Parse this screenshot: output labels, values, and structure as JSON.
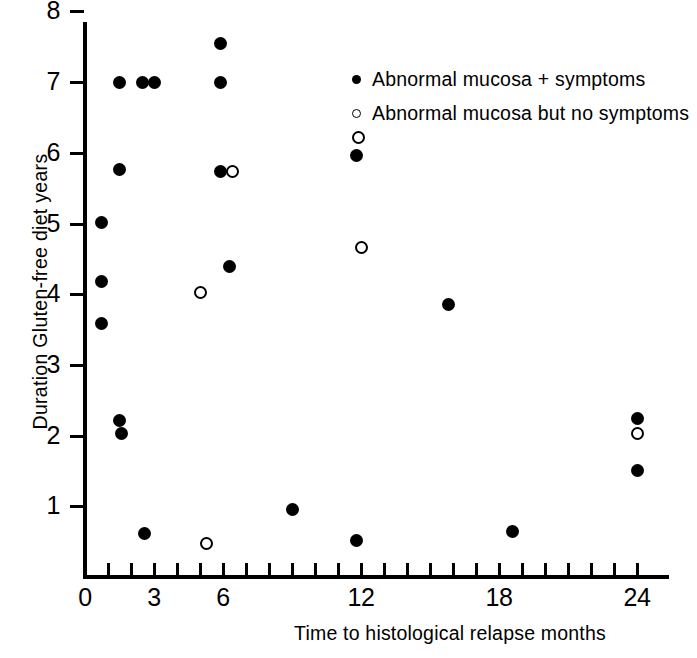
{
  "chart_data": {
    "type": "scatter",
    "title": "",
    "xlabel": "Time to histological relapse months",
    "ylabel": "Duration Gluten-free diet years",
    "xlim": [
      0,
      25
    ],
    "ylim": [
      0,
      8
    ],
    "grid": false,
    "legend_position": "top-right",
    "x_ticks_major": [
      0,
      3,
      6,
      12,
      18,
      24
    ],
    "x_tick_labels": [
      "0",
      "3",
      "6",
      "12",
      "18",
      "24"
    ],
    "x_ticks_minor_step": 1,
    "y_ticks_major": [
      1,
      2,
      3,
      4,
      5,
      6,
      7,
      8
    ],
    "y_tick_labels": [
      "1",
      "2",
      "3",
      "4",
      "5",
      "6",
      "7",
      "8"
    ],
    "y_minor_ticks": [
      0.5,
      1.5,
      2.5,
      3.5,
      4.5,
      5.5,
      6.5,
      7.5
    ],
    "marker_color": "#000000",
    "series": [
      {
        "name": "Abnormal mucosa + symptoms",
        "marker": "filled-circle",
        "points": [
          {
            "x": 0.7,
            "y": 5.02
          },
          {
            "x": 0.7,
            "y": 4.18
          },
          {
            "x": 0.7,
            "y": 3.58
          },
          {
            "x": 1.5,
            "y": 7.0
          },
          {
            "x": 1.5,
            "y": 5.76
          },
          {
            "x": 1.5,
            "y": 2.22
          },
          {
            "x": 1.6,
            "y": 2.03
          },
          {
            "x": 2.5,
            "y": 7.0
          },
          {
            "x": 3.0,
            "y": 7.0
          },
          {
            "x": 2.6,
            "y": 0.62
          },
          {
            "x": 5.9,
            "y": 7.54
          },
          {
            "x": 5.9,
            "y": 7.0
          },
          {
            "x": 5.9,
            "y": 5.73
          },
          {
            "x": 6.3,
            "y": 4.39
          },
          {
            "x": 9.0,
            "y": 0.96
          },
          {
            "x": 11.8,
            "y": 5.96
          },
          {
            "x": 11.8,
            "y": 0.52
          },
          {
            "x": 15.8,
            "y": 3.85
          },
          {
            "x": 18.6,
            "y": 0.64
          },
          {
            "x": 24.0,
            "y": 2.24
          },
          {
            "x": 24.0,
            "y": 1.51
          }
        ]
      },
      {
        "name": "Abnormal mucosa but no symptoms",
        "marker": "open-circle",
        "points": [
          {
            "x": 5.3,
            "y": 0.48
          },
          {
            "x": 5.0,
            "y": 4.03
          },
          {
            "x": 6.4,
            "y": 5.73
          },
          {
            "x": 11.9,
            "y": 6.22
          },
          {
            "x": 12.0,
            "y": 4.66
          },
          {
            "x": 24.0,
            "y": 2.03
          }
        ]
      }
    ]
  },
  "legend": {
    "entries": [
      {
        "marker": "filled-circle",
        "label": "Abnormal mucosa + symptoms"
      },
      {
        "marker": "open-circle",
        "label": "Abnormal mucosa but no symptoms"
      }
    ]
  }
}
